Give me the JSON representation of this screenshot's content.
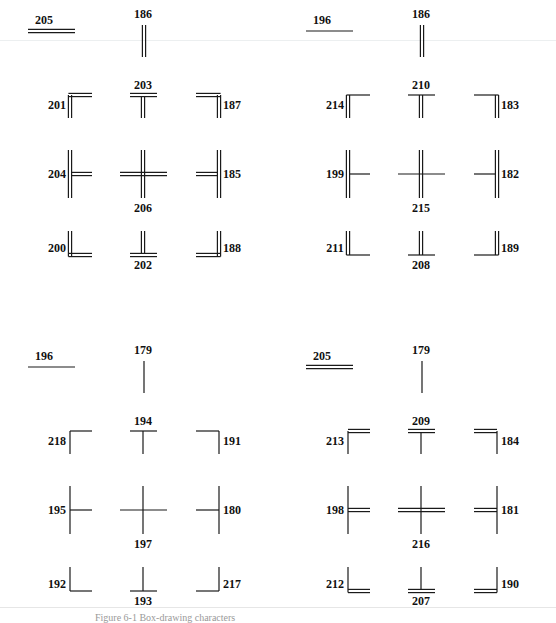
{
  "figure": {
    "caption": "Figure 6-1  Box-drawing characters",
    "panels": [
      {
        "id": "double-double",
        "horizontal": {
          "code": "205",
          "style": "double"
        },
        "vertical": {
          "code": "186",
          "style": "double"
        },
        "grid": [
          [
            "201",
            "203",
            "187"
          ],
          [
            "204",
            "206",
            "185"
          ],
          [
            "200",
            "202",
            "188"
          ]
        ]
      },
      {
        "id": "single-horizontal-double-vertical",
        "horizontal": {
          "code": "196",
          "style": "single"
        },
        "vertical": {
          "code": "186",
          "style": "double"
        },
        "grid": [
          [
            "214",
            "210",
            "183"
          ],
          [
            "199",
            "215",
            "182"
          ],
          [
            "211",
            "208",
            "189"
          ]
        ]
      },
      {
        "id": "single-single",
        "horizontal": {
          "code": "196",
          "style": "single"
        },
        "vertical": {
          "code": "179",
          "style": "single"
        },
        "grid": [
          [
            "218",
            "194",
            "191"
          ],
          [
            "195",
            "197",
            "180"
          ],
          [
            "192",
            "193",
            "217"
          ]
        ]
      },
      {
        "id": "double-horizontal-single-vertical",
        "horizontal": {
          "code": "205",
          "style": "double"
        },
        "vertical": {
          "code": "179",
          "style": "single"
        },
        "grid": [
          [
            "213",
            "209",
            "184"
          ],
          [
            "198",
            "216",
            "181"
          ],
          [
            "212",
            "207",
            "190"
          ]
        ]
      }
    ]
  },
  "colors": {
    "ink": "#1a1a1a",
    "background": "#ffffff"
  }
}
